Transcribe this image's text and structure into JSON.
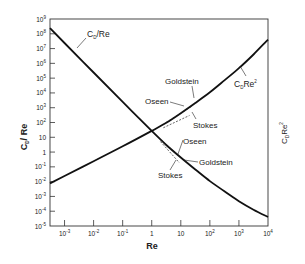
{
  "chart_data": {
    "type": "line",
    "title": "",
    "xlabel": "Re",
    "ylabel": "C_D / Re",
    "ylabel_right": "C_D Re^2",
    "xscale": "log",
    "yscale": "log",
    "xlim": [
      0.000316,
      10000
    ],
    "ylim": [
      1e-05,
      1000000000
    ],
    "grid": false,
    "legend": "none (curves labeled directly)",
    "x_ticks": [
      "10^-3",
      "10^-2",
      "10^-1",
      "1",
      "10",
      "10^2",
      "10^3",
      "10^4"
    ],
    "y_ticks": [
      "10^-5",
      "10^-4",
      "10^-3",
      "10^-2",
      "10^-1",
      "1",
      "10",
      "10^2",
      "10^3",
      "10^4",
      "10^5",
      "10^6",
      "10^7",
      "10^8",
      "10^9"
    ],
    "log10_x": [
      -3.5,
      -3,
      -2,
      -1,
      0,
      0.5,
      1,
      1.5,
      2,
      2.5,
      3,
      3.5,
      4
    ],
    "series": [
      {
        "name": "C_D/Re",
        "label": "C_D/Re",
        "log10_values": [
          8.38,
          7.38,
          5.38,
          3.39,
          1.43,
          0.48,
          -0.37,
          -1.18,
          -1.96,
          -2.65,
          -3.33,
          -3.9,
          -4.39
        ]
      },
      {
        "name": "C_D Re^2",
        "label": "C_DRe^2",
        "log10_values": [
          -2.12,
          -1.62,
          -0.62,
          0.39,
          1.43,
          1.98,
          2.63,
          3.32,
          4.04,
          4.85,
          5.67,
          6.6,
          7.61
        ]
      }
    ],
    "annotations": [
      {
        "text": "Goldstein",
        "curve": "C_D Re^2",
        "near_log10_x": 1.3
      },
      {
        "text": "Oseen",
        "curve": "C_D Re^2",
        "near_log10_x": 0.9
      },
      {
        "text": "Stokes",
        "curve": "C_D Re^2",
        "near_log10_x": 1.1
      },
      {
        "text": "Oseen",
        "curve": "C_D/Re",
        "near_log10_x": 0.6
      },
      {
        "text": "Goldstein",
        "curve": "C_D/Re",
        "near_log10_x": 0.8
      },
      {
        "text": "Stokes",
        "curve": "C_D/Re",
        "near_log10_x": 0.7
      }
    ]
  },
  "labels": {
    "x_axis_title": "Re",
    "y_axis_left_title": "C",
    "y_axis_left_sub": "D",
    "y_axis_left_rest": "/ Re",
    "y_axis_right_title": "C",
    "y_axis_right_sub": "D",
    "y_axis_right_rest": "Re",
    "y_axis_right_sup": "2",
    "curve1_main": "C",
    "curve1_sub": "D",
    "curve1_rest": "/Re",
    "curve2_main": "C",
    "curve2_sub": "D",
    "curve2_rest": "Re",
    "curve2_sup": "2",
    "ann_goldstein_top": "Goldstein",
    "ann_oseen_top": "Oseen",
    "ann_stokes_top": "Stokes",
    "ann_oseen_bottom": "Oseen",
    "ann_goldstein_bottom": "Goldstein",
    "ann_stokes_bottom": "Stokes"
  },
  "colors": {
    "curve": "#111111",
    "axis": "#333333",
    "background": "#ffffff"
  }
}
